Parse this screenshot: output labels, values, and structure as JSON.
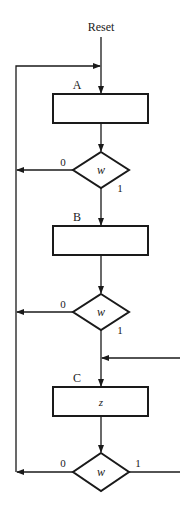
{
  "diagram": {
    "type": "ASM flowchart",
    "reset_label": "Reset",
    "states": [
      {
        "name": "A",
        "output": ""
      },
      {
        "name": "B",
        "output": ""
      },
      {
        "name": "C",
        "output": "z"
      }
    ],
    "decisions": [
      {
        "condition": "w",
        "false_label": "0",
        "true_label": "1"
      },
      {
        "condition": "w",
        "false_label": "0",
        "true_label": "1"
      },
      {
        "condition": "w",
        "false_label": "0",
        "true_label": "1"
      }
    ],
    "colors": {
      "stroke": "#1a1a1a",
      "background": "#ffffff"
    }
  }
}
